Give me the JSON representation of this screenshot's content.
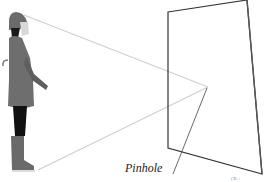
{
  "diagram": {
    "labels": {
      "pinhole": "Pinhole",
      "corner_caption": "(Te  :"
    },
    "colors": {
      "rays": "#c8c8c8",
      "plane": "#333333",
      "figure_coat": "#6a6a6a",
      "figure_legs": "#111111"
    },
    "elements": {
      "subject": "Person in raincoat and hat holding umbrella",
      "image_plane": "Projection plane",
      "rays": [
        "head-to-pinhole",
        "feet-to-pinhole"
      ]
    }
  }
}
